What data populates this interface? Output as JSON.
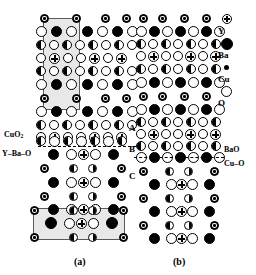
{
  "figure": {
    "panels": [
      {
        "id": "a",
        "caption": "(a)"
      },
      {
        "id": "b",
        "caption": "(b)"
      }
    ]
  },
  "legend": {
    "title": "",
    "entries": [
      {
        "symbol": "Y",
        "label": "Y",
        "glyph": "circle-with-cross-icon"
      },
      {
        "symbol": "Ba",
        "label": "Ba",
        "glyph": "filled-circle-icon"
      },
      {
        "symbol": "Cu",
        "label": "Cu",
        "glyph": "small-dot-icon"
      },
      {
        "symbol": "O",
        "label": "O",
        "glyph": "open-circle-icon"
      }
    ]
  },
  "annotations": {
    "panel_a": {
      "cuo2": "CuO2",
      "cuo2_html": "CuO<sub>2</sub>",
      "y_ba_o": "Y–Ba–O",
      "caption": "(a)"
    },
    "panel_b": {
      "region_a": "A",
      "region_b": "B",
      "region_c": "C",
      "bao": "BaO",
      "cu_o": "Cu–O",
      "caption": "(b)"
    }
  },
  "colors": {
    "atom_fill_dark": "#000000",
    "atom_fill_light": "#ffffff",
    "outline": "#000000",
    "cell_highlight": "#e8e8e8",
    "cell_border": "#5a5a5a",
    "background": "#ffffff"
  },
  "structure": {
    "description": "YBa2Cu3O7 crystal lattice projection, two panels",
    "species_order": [
      "Y",
      "Ba",
      "Cu",
      "O"
    ]
  }
}
